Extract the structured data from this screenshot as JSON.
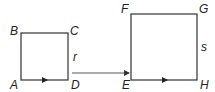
{
  "diagram": {
    "small_square": {
      "vertices": {
        "top_left": "B",
        "top_right": "C",
        "bottom_right": "D",
        "bottom_left": "A"
      },
      "side_label": "r"
    },
    "large_square": {
      "vertices": {
        "top_left": "F",
        "top_right": "G",
        "bottom_right": "H",
        "bottom_left": "E"
      },
      "side_label": "s"
    },
    "colors": {
      "stroke": "#333333",
      "connector": "#555555"
    }
  }
}
